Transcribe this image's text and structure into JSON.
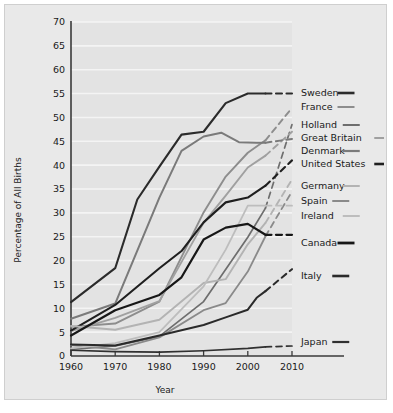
{
  "chart_data": {
    "type": "line",
    "title": "",
    "xlabel": "Year",
    "ylabel": "Percentage of All Births",
    "xlim": [
      1960,
      2010
    ],
    "ylim": [
      0,
      70
    ],
    "xticks": [
      "1960",
      "1970",
      "1980",
      "1990",
      "2000",
      "2010"
    ],
    "yticks": [
      "0",
      "5",
      "10",
      "15",
      "20",
      "25",
      "30",
      "35",
      "40",
      "45",
      "50",
      "55",
      "60",
      "65",
      "70"
    ],
    "grid": "horizontal",
    "legend_position": "right",
    "projection_note": "dashed segments are projections beyond last observed year",
    "series": [
      {
        "name": "Sweden",
        "color": "#2b2b2b",
        "width": 2.1,
        "x": [
          1960,
          1970,
          1975,
          1980,
          1985,
          1990,
          1995,
          2000,
          2004
        ],
        "y": [
          11.3,
          18.4,
          32.8,
          39.7,
          46.4,
          47.0,
          53.0,
          55.0,
          55.0
        ],
        "projected_x": [
          2004,
          2010
        ],
        "projected_y": [
          55.0,
          55.0
        ]
      },
      {
        "name": "France",
        "color": "#8d8d8d",
        "width": 1.9,
        "x": [
          1960,
          1970,
          1980,
          1990,
          1995,
          2000,
          2004
        ],
        "y": [
          6.1,
          6.8,
          11.4,
          30.1,
          37.6,
          42.6,
          45.2
        ],
        "projected_x": [
          2004,
          2010
        ],
        "projected_y": [
          45.2,
          52.0
        ]
      },
      {
        "name": "Holland",
        "color": "#6e6e6e",
        "width": 1.7,
        "x": [
          1960,
          1970,
          1980,
          1990,
          2000,
          2004
        ],
        "y": [
          1.4,
          2.1,
          4.1,
          11.4,
          24.9,
          31.0
        ],
        "projected_x": [
          2004,
          2010
        ],
        "projected_y": [
          31.0,
          48.5
        ]
      },
      {
        "name": "Great Britain",
        "color": "#a0a0a0",
        "width": 1.9,
        "x": [
          1960,
          1970,
          1980,
          1990,
          1995,
          2000,
          2004
        ],
        "y": [
          5.2,
          8.0,
          11.5,
          27.9,
          33.6,
          39.5,
          42.0
        ],
        "projected_x": [
          2004,
          2010
        ],
        "projected_y": [
          42.0,
          47.0
        ]
      },
      {
        "name": "Denmark",
        "color": "#7a7a7a",
        "width": 2.0,
        "x": [
          1960,
          1970,
          1980,
          1985,
          1990,
          1994,
          1998,
          2002,
          2004
        ],
        "y": [
          7.8,
          11.0,
          33.2,
          43.0,
          46.0,
          46.8,
          44.8,
          44.7,
          44.7
        ],
        "projected_x": [
          2004,
          2010
        ],
        "projected_y": [
          44.7,
          45.5
        ]
      },
      {
        "name": "United States",
        "color": "#1f1f1f",
        "width": 2.1,
        "x": [
          1960,
          1970,
          1980,
          1985,
          1990,
          1995,
          2000,
          2004
        ],
        "y": [
          5.3,
          10.7,
          18.4,
          22.0,
          28.0,
          32.2,
          33.2,
          35.7
        ],
        "projected_x": [
          2004,
          2010
        ],
        "projected_y": [
          35.7,
          41.0
        ]
      },
      {
        "name": "Germany",
        "color": "#b3b3b3",
        "width": 1.9,
        "x": [
          1960,
          1970,
          1980,
          1990,
          1995,
          2000,
          2004
        ],
        "y": [
          6.3,
          5.5,
          7.6,
          15.3,
          16.1,
          23.4,
          27.9
        ],
        "projected_x": [
          2004,
          2010
        ],
        "projected_y": [
          27.9,
          37.0
        ]
      },
      {
        "name": "Spain",
        "color": "#8a8a8a",
        "width": 1.8,
        "x": [
          1960,
          1970,
          1980,
          1990,
          1995,
          2000,
          2004
        ],
        "y": [
          2.3,
          1.4,
          3.9,
          9.6,
          11.1,
          17.7,
          25.1
        ],
        "projected_x": [
          2004,
          2010
        ],
        "projected_y": [
          25.1,
          34.5
        ]
      },
      {
        "name": "Ireland",
        "color": "#bdbdbd",
        "width": 1.8,
        "x": [
          1960,
          1970,
          1980,
          1990,
          1995,
          2000,
          2004
        ],
        "y": [
          1.6,
          2.7,
          5.0,
          14.6,
          22.3,
          31.5,
          31.5
        ],
        "projected_x": [
          2004,
          2010
        ],
        "projected_y": [
          31.5,
          31.5
        ]
      },
      {
        "name": "Canada",
        "color": "#171717",
        "width": 2.2,
        "x": [
          1960,
          1970,
          1980,
          1985,
          1990,
          1995,
          2000,
          2004
        ],
        "y": [
          4.3,
          9.6,
          12.8,
          16.5,
          24.4,
          26.9,
          27.7,
          25.4
        ],
        "projected_x": [
          2004,
          2010
        ],
        "projected_y": [
          25.4,
          25.4
        ]
      },
      {
        "name": "Italy",
        "color": "#2a2a2a",
        "width": 2.0,
        "x": [
          1960,
          1970,
          1980,
          1990,
          1995,
          2000,
          2002,
          2004
        ],
        "y": [
          2.4,
          2.2,
          4.3,
          6.5,
          8.1,
          9.7,
          12.2,
          13.6
        ],
        "projected_x": [
          2004,
          2010
        ],
        "projected_y": [
          13.6,
          18.2
        ]
      },
      {
        "name": "Japan",
        "color": "#303030",
        "width": 1.7,
        "x": [
          1960,
          1970,
          1980,
          1990,
          2000,
          2004
        ],
        "y": [
          1.2,
          0.9,
          0.8,
          1.1,
          1.6,
          1.9
        ],
        "projected_x": [
          2004,
          2010
        ],
        "projected_y": [
          1.9,
          2.1
        ]
      }
    ],
    "legend_entries": [
      {
        "label": "Sweden",
        "color": "#2b2b2b",
        "width": 2.6,
        "y": 88
      },
      {
        "label": "France",
        "color": "#8d8d8d",
        "width": 2.0,
        "y": 102
      },
      {
        "label": "Holland",
        "color": "#6e6e6e",
        "width": 2.0,
        "y": 120
      },
      {
        "label": "Great Britain",
        "color": "#a0a0a0",
        "width": 2.0,
        "y": 133
      },
      {
        "label": "Denmark",
        "color": "#7a7a7a",
        "width": 2.2,
        "y": 146
      },
      {
        "label": "United States",
        "color": "#1f1f1f",
        "width": 2.6,
        "y": 159
      },
      {
        "label": "Germany",
        "color": "#b3b3b3",
        "width": 2.0,
        "y": 181
      },
      {
        "label": "Spain",
        "color": "#8a8a8a",
        "width": 2.0,
        "y": 196
      },
      {
        "label": "Ireland",
        "color": "#bdbdbd",
        "width": 2.0,
        "y": 211
      },
      {
        "label": "Canada",
        "color": "#171717",
        "width": 2.8,
        "y": 238
      },
      {
        "label": "Italy",
        "color": "#2a2a2a",
        "width": 2.6,
        "y": 271
      },
      {
        "label": "Japan",
        "color": "#303030",
        "width": 2.2,
        "y": 337
      }
    ]
  },
  "colors": {
    "figure_background": "#e9e9e9",
    "plot_background": "#e3e3e3",
    "gridline": "#f4f4f4",
    "axis": "#3a3a3a",
    "text": "#1a1a1a"
  }
}
